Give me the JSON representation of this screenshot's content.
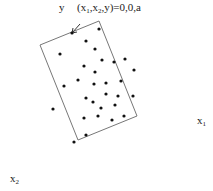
{
  "diagram": {
    "top_label_axis": "y",
    "top_label_eq": "(x",
    "top_label_sub1": "1",
    "top_label_mid": ",x",
    "top_label_sub2": "2",
    "top_label_end": ",y)=0,0,a",
    "x1_label": "x",
    "x1_sub": "1",
    "x2_label": "x",
    "x2_sub": "2",
    "rectangle": [
      [
        40,
        45
      ],
      [
        99,
        21
      ],
      [
        137,
        116
      ],
      [
        78,
        140
      ]
    ],
    "arrow": {
      "from": [
        80,
        24
      ],
      "to": [
        72,
        33
      ]
    },
    "points": [
      [
        72,
        33
      ],
      [
        99,
        29
      ],
      [
        86,
        41
      ],
      [
        60,
        54
      ],
      [
        95,
        49
      ],
      [
        102,
        60
      ],
      [
        114,
        62
      ],
      [
        125,
        59
      ],
      [
        84,
        66
      ],
      [
        95,
        72
      ],
      [
        134,
        70
      ],
      [
        78,
        80
      ],
      [
        94,
        84
      ],
      [
        106,
        83
      ],
      [
        121,
        81
      ],
      [
        64,
        86
      ],
      [
        86,
        98
      ],
      [
        106,
        94
      ],
      [
        118,
        96
      ],
      [
        133,
        96
      ],
      [
        93,
        102
      ],
      [
        101,
        108
      ],
      [
        115,
        105
      ],
      [
        53,
        109
      ],
      [
        84,
        118
      ],
      [
        98,
        116
      ],
      [
        112,
        120
      ],
      [
        124,
        116
      ],
      [
        86,
        135
      ],
      [
        74,
        142
      ]
    ]
  }
}
